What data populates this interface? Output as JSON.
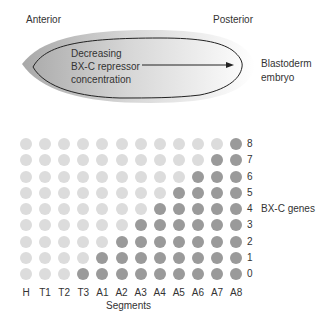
{
  "embryo": {
    "anterior_label": "Anterior",
    "posterior_label": "Posterior",
    "gradient_text": [
      "Decreasing",
      "BX-C repressor",
      "concentration"
    ],
    "side_label": [
      "Blastoderm",
      "embryo"
    ]
  },
  "grid": {
    "gene_axis_label": "BX-C genes",
    "segment_axis_label": "Segments",
    "segments": [
      "H",
      "T1",
      "T2",
      "T3",
      "A1",
      "A2",
      "A3",
      "A4",
      "A5",
      "A6",
      "A7",
      "A8"
    ],
    "genes": [
      "8",
      "7",
      "6",
      "5",
      "4",
      "3",
      "2",
      "1",
      "0"
    ],
    "active_color": "#9a9a9a",
    "inactive_color": "#dcdcdc"
  },
  "chart_data": {
    "type": "heatmap",
    "xlabel": "Segments",
    "ylabel": "BX-C genes",
    "x": [
      "H",
      "T1",
      "T2",
      "T3",
      "A1",
      "A2",
      "A3",
      "A4",
      "A5",
      "A6",
      "A7",
      "A8"
    ],
    "y": [
      0,
      1,
      2,
      3,
      4,
      5,
      6,
      7,
      8
    ],
    "active_genes_per_segment": {
      "H": [],
      "T1": [],
      "T2": [],
      "T3": [
        0
      ],
      "A1": [
        0,
        1
      ],
      "A2": [
        0,
        1,
        2
      ],
      "A3": [
        0,
        1,
        2,
        3
      ],
      "A4": [
        0,
        1,
        2,
        3,
        4
      ],
      "A5": [
        0,
        1,
        2,
        3,
        4,
        5
      ],
      "A6": [
        0,
        1,
        2,
        3,
        4,
        5,
        6
      ],
      "A7": [
        0,
        1,
        2,
        3,
        4,
        5,
        6,
        7
      ],
      "A8": [
        0,
        1,
        2,
        3,
        4,
        5,
        6,
        7,
        8
      ]
    },
    "legend": {
      "dark": "gene active",
      "light": "gene repressed"
    }
  }
}
